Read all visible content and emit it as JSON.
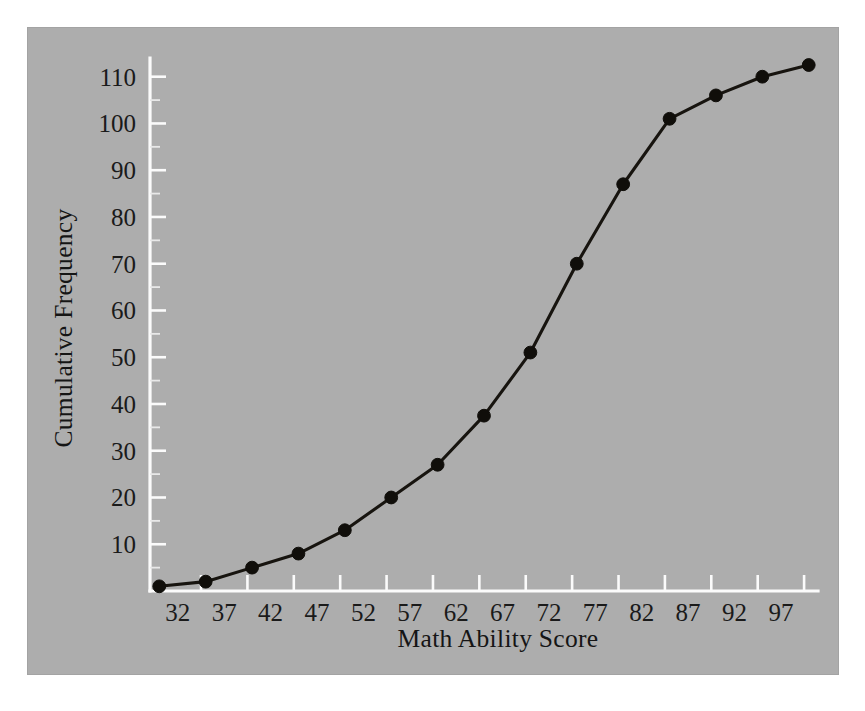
{
  "figure": {
    "panel_background": "#adadad",
    "page_background": "#ffffff",
    "axis_color": "#fbfbfb",
    "series_color": "#100e0a"
  },
  "chart_data": {
    "type": "line",
    "title": "",
    "subtitle": "",
    "xlabel": "Math Ability Score",
    "ylabel": "Cumulative Frequency",
    "grid": false,
    "legend": null,
    "legend_position": "none",
    "xlim": [
      29,
      101
    ],
    "ylim": [
      0,
      114
    ],
    "x_tick_labels": [
      "32",
      "37",
      "42",
      "47",
      "52",
      "57",
      "62",
      "67",
      "72",
      "77",
      "82",
      "87",
      "92",
      "97"
    ],
    "x_tick_values": [
      32,
      37,
      42,
      47,
      52,
      57,
      62,
      67,
      72,
      77,
      82,
      87,
      92,
      97
    ],
    "y_tick_labels": [
      "10",
      "20",
      "30",
      "40",
      "50",
      "60",
      "70",
      "80",
      "90",
      "100",
      "110"
    ],
    "y_tick_values": [
      10,
      20,
      30,
      40,
      50,
      60,
      70,
      80,
      90,
      100,
      110
    ],
    "x": [
      30,
      35,
      40,
      45,
      50,
      55,
      60,
      65,
      70,
      75,
      80,
      85,
      90,
      95,
      100
    ],
    "values": [
      1,
      2,
      5,
      8,
      13,
      20,
      27,
      37.5,
      51,
      70,
      87,
      101,
      106,
      110,
      112.5
    ],
    "series": [
      {
        "name": "Cumulative Frequency",
        "marker": "filled-circle",
        "values": [
          1,
          2,
          5,
          8,
          13,
          20,
          27,
          37.5,
          51,
          70,
          87,
          101,
          106,
          110,
          112.5
        ]
      }
    ],
    "annotations": []
  }
}
